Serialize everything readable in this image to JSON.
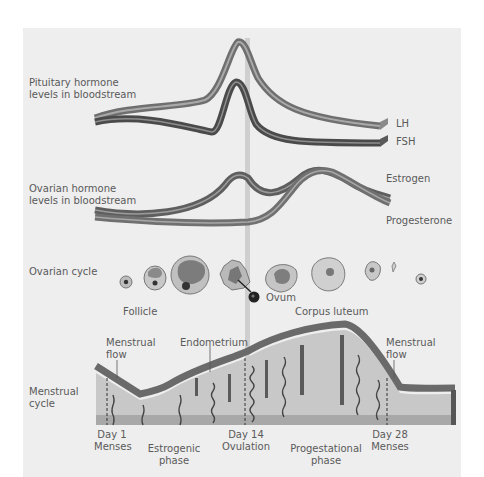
{
  "section_labels": {
    "pituitary": [
      "Pituitary hormone",
      "levels in bloodstream"
    ],
    "ovarian_hormone": [
      "Ovarian hormone",
      "levels in bloodstream"
    ],
    "ovarian_cycle": "Ovarian cycle",
    "menstrual_cycle": [
      "Menstrual",
      "cycle"
    ]
  },
  "hormone_labels": {
    "lh": "LH",
    "fsh": "FSH",
    "estrogen": "Estrogen",
    "progesterone": "Progesterone"
  },
  "ovarian_labels": {
    "follicle": "Follicle",
    "ovum": "Ovum",
    "corpus_luteum": "Corpus luteum"
  },
  "endometrium_labels": {
    "menstrual_flow_left": [
      "Menstrual",
      "flow"
    ],
    "endometrium": "Endometrium",
    "menstrual_flow_right": [
      "Menstrual",
      "flow"
    ]
  },
  "timeline": [
    {
      "day": "Day 1",
      "event": "Menses"
    },
    {
      "day": "",
      "event": "Estrogenic",
      "event2": "phase"
    },
    {
      "day": "Day 14",
      "event": "Ovulation"
    },
    {
      "day": "",
      "event": "Progestational",
      "event2": "phase"
    },
    {
      "day": "Day 28",
      "event": "Menses"
    }
  ],
  "colors": {
    "panel_bg": "#eeeeee",
    "lh_band": "#8a8a8a",
    "fsh_band": "#5a5a5a",
    "ovulation_line": "#cfcfcf",
    "endometrium_fill": "#c8c8c8",
    "endometrium_top": "#6e6e6e",
    "base_layer": "#a8a8a8"
  }
}
